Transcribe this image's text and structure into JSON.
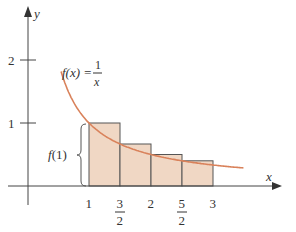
{
  "chart_data": {
    "type": "area",
    "title": "",
    "function_label": "f(x) =",
    "function_numerator": "1",
    "function_denominator": "x",
    "xlabel": "x",
    "ylabel": "y",
    "x_ticks": [
      {
        "value": 1,
        "label": "1"
      },
      {
        "value": 1.5,
        "label_num": "3",
        "label_den": "2"
      },
      {
        "value": 2,
        "label": "2"
      },
      {
        "value": 2.5,
        "label_num": "5",
        "label_den": "2"
      },
      {
        "value": 3,
        "label": "3"
      }
    ],
    "y_ticks": [
      {
        "value": 1,
        "label": "1"
      },
      {
        "value": 2,
        "label": "2"
      }
    ],
    "rectangles": [
      {
        "x0": 1,
        "x1": 1.5,
        "height": 1.0
      },
      {
        "x0": 1.5,
        "x1": 2,
        "height": 0.6667
      },
      {
        "x0": 2,
        "x1": 2.5,
        "height": 0.5
      },
      {
        "x0": 2.5,
        "x1": 3,
        "height": 0.4
      }
    ],
    "brace_label": "f(1)",
    "curve": "y = 1/x",
    "curve_x_range": [
      0.55,
      3.5
    ],
    "colors": {
      "curve": "#d9825b",
      "fill": "#f0d7c4",
      "axis": "#444444"
    }
  }
}
